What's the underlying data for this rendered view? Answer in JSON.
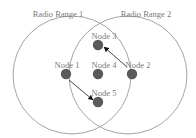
{
  "diagram": {
    "title": "",
    "ranges": [
      {
        "id": "range1",
        "label": "Radio Range 1",
        "cx": 72,
        "cy": 75,
        "r": 59,
        "label_x": 58,
        "label_y": 17
      },
      {
        "id": "range2",
        "label": "Radio Range 2",
        "cx": 128,
        "cy": 75,
        "r": 59,
        "label_x": 146,
        "label_y": 17
      }
    ],
    "nodes": [
      {
        "id": "node1",
        "label": "Node 1",
        "cx": 66,
        "cy": 74,
        "label_x": 67,
        "label_y": 68
      },
      {
        "id": "node2",
        "label": "Node 2",
        "cx": 132,
        "cy": 74,
        "label_x": 138,
        "label_y": 68
      },
      {
        "id": "node3",
        "label": "Node 3",
        "cx": 98,
        "cy": 45,
        "label_x": 104,
        "label_y": 39
      },
      {
        "id": "node4",
        "label": "Node 4",
        "cx": 98,
        "cy": 74,
        "label_x": 104,
        "label_y": 68
      },
      {
        "id": "node5",
        "label": "Node 5",
        "cx": 98,
        "cy": 102,
        "label_x": 104,
        "label_y": 96
      }
    ],
    "arrows": [
      {
        "from": "node2",
        "to": "node3",
        "x1": 127,
        "y1": 67,
        "x2": 104,
        "y2": 47
      },
      {
        "from": "node1",
        "to": "node5",
        "x1": 69,
        "y1": 80,
        "x2": 93,
        "y2": 100
      }
    ],
    "colors": {
      "node_fill": "#5a5a5a",
      "range_stroke": "#9a9a9a",
      "label_text": "#7a7a7a",
      "arrow": "#222222",
      "background": "#ffffff"
    }
  }
}
